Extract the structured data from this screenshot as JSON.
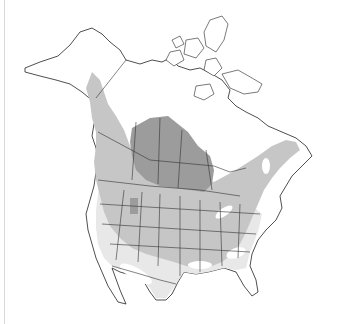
{
  "map": {
    "type": "species range map",
    "region": "North America",
    "legend_colors": {
      "breeding": "#9c9c9c",
      "year_round": "#c6c6c6",
      "nonbreeding": "#e8e8e8",
      "outside_range": "#ffffff",
      "outline": "#222222"
    },
    "visible_text": []
  }
}
